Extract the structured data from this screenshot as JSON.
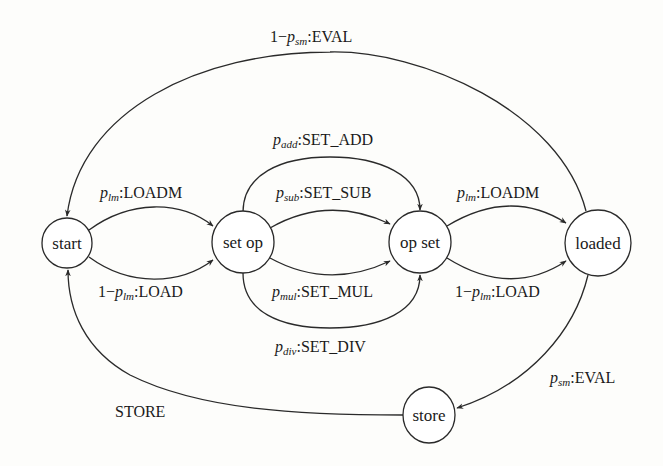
{
  "diagram": {
    "type": "state-machine",
    "nodes": [
      {
        "id": "start",
        "label": "start"
      },
      {
        "id": "set_op",
        "label": "set op"
      },
      {
        "id": "op_set",
        "label": "op set"
      },
      {
        "id": "loaded",
        "label": "loaded"
      },
      {
        "id": "store",
        "label": "store"
      }
    ],
    "edges": [
      {
        "from": "loaded",
        "to": "start",
        "prefix": "1−",
        "prob_sym": "p",
        "prob_sub": "sm",
        "action": ":EVAL"
      },
      {
        "from": "start",
        "to": "set_op",
        "prefix": "",
        "prob_sym": "p",
        "prob_sub": "lm",
        "action": ":LOADM"
      },
      {
        "from": "start",
        "to": "set_op",
        "prefix": "1−",
        "prob_sym": "p",
        "prob_sub": "lm",
        "action": ":LOAD"
      },
      {
        "from": "set_op",
        "to": "op_set",
        "prefix": "",
        "prob_sym": "p",
        "prob_sub": "add",
        "action": ":SET_ADD"
      },
      {
        "from": "set_op",
        "to": "op_set",
        "prefix": "",
        "prob_sym": "p",
        "prob_sub": "sub",
        "action": ":SET_SUB"
      },
      {
        "from": "set_op",
        "to": "op_set",
        "prefix": "",
        "prob_sym": "p",
        "prob_sub": "mul",
        "action": ":SET_MUL"
      },
      {
        "from": "set_op",
        "to": "op_set",
        "prefix": "",
        "prob_sym": "p",
        "prob_sub": "div",
        "action": ":SET_DIV"
      },
      {
        "from": "op_set",
        "to": "loaded",
        "prefix": "",
        "prob_sym": "p",
        "prob_sub": "lm",
        "action": ":LOADM"
      },
      {
        "from": "op_set",
        "to": "loaded",
        "prefix": "1−",
        "prob_sym": "p",
        "prob_sub": "lm",
        "action": ":LOAD"
      },
      {
        "from": "loaded",
        "to": "store",
        "prefix": "",
        "prob_sym": "p",
        "prob_sub": "sm",
        "action": ":EVAL"
      },
      {
        "from": "store",
        "to": "start",
        "prefix": "",
        "prob_sym": "",
        "prob_sub": "",
        "action": "STORE"
      }
    ]
  }
}
